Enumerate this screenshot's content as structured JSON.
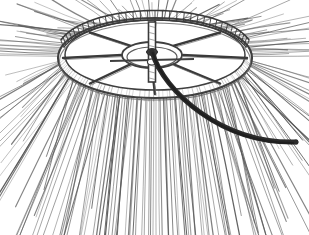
{
  "figure": {
    "title": "Rotary brush head",
    "medium": "line engraving",
    "caption": "",
    "background_color": "#ffffff",
    "ink_color": "#4a4a4a",
    "dark_ink_color": "#2b2b2b",
    "light_ink_color": "#6f6f6f",
    "canvas": {
      "width": 309,
      "height": 235
    }
  },
  "parts": {
    "rim": {
      "name": "wheel-rim",
      "center_x": 155,
      "center_y": 58,
      "radius_x": 97,
      "radius_y": 40,
      "band_thickness": 9,
      "stroke_color": "#3f3f3f"
    },
    "toothed_band": {
      "name": "toothed-rim-band",
      "tooth_count": 34,
      "arc_start_deg": 196,
      "arc_end_deg": 344,
      "stroke_color": "#3a3a3a"
    },
    "hub": {
      "name": "wheel-hub",
      "center_x": 152,
      "center_y": 55,
      "radius_x": 30,
      "radius_y": 13,
      "stroke_color": "#3f3f3f"
    },
    "spokes": {
      "name": "wheel-spokes",
      "count": 8,
      "stroke_color": "#3a3a3a"
    },
    "spindle": {
      "name": "center-spindle",
      "x": 152,
      "top_y": 22,
      "bottom_y": 82,
      "width": 7,
      "stroke_color": "#3a3a3a"
    },
    "curved_arm": {
      "name": "curved-sweep-arm",
      "start_x": 152,
      "start_y": 52,
      "end_x": 296,
      "end_y": 142,
      "thickness": 5,
      "color": "#2b2b2b"
    },
    "bristles": {
      "name": "bristle-fan",
      "count": 210,
      "spread_start_deg": 172,
      "spread_end_deg": 368,
      "inner_radius": 1.0,
      "outer_min": 1.35,
      "outer_max": 2.2,
      "color": "#565656"
    }
  },
  "chart_data": {
    "type": "scatter",
    "xlabel": "",
    "ylabel": "",
    "categories": [
      "wheel-rim",
      "toothed-rim-band",
      "wheel-hub",
      "wheel-spokes",
      "center-spindle",
      "curved-sweep-arm",
      "bristle-fan"
    ],
    "values": [
      1,
      34,
      1,
      8,
      1,
      1,
      210
    ]
  }
}
